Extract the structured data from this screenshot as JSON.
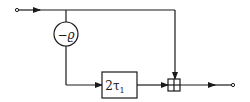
{
  "diagram": {
    "type": "signal-flow block diagram",
    "nodes": {
      "input": {
        "label": ""
      },
      "gain": {
        "label": "−ϱ",
        "shape": "circle"
      },
      "delay": {
        "label": "2τ",
        "subscript": "1",
        "shape": "rectangle"
      },
      "adder": {
        "label": "",
        "shape": "summing-box"
      },
      "output": {
        "label": ""
      }
    },
    "edges": [
      {
        "from": "input",
        "to": "adder",
        "path": "top feed-forward"
      },
      {
        "from": "input",
        "to": "gain"
      },
      {
        "from": "gain",
        "to": "delay"
      },
      {
        "from": "delay",
        "to": "adder"
      },
      {
        "from": "adder",
        "to": "output"
      }
    ],
    "colors": {
      "stroke": "#1a1a1a",
      "background": "#ffffff"
    }
  }
}
